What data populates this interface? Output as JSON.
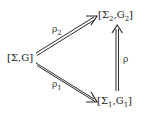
{
  "diagram": {
    "type": "commutative-triangle",
    "nodes": [
      {
        "id": "sigma_g",
        "open": "[",
        "main1": "Σ",
        "sub1": "",
        "sep": ",",
        "main2": "G",
        "sub2": "",
        "close": "]",
        "x": 8,
        "y": 61
      },
      {
        "id": "sigma2_g2",
        "open": "[",
        "main1": "Σ",
        "sub1": "2",
        "sep": ",",
        "main2": "G",
        "sub2": "2",
        "close": "]",
        "x": 99,
        "y": 18
      },
      {
        "id": "sigma1_g1",
        "open": "[",
        "main1": "Σ",
        "sub1": "1",
        "sep": ",",
        "main2": "G",
        "sub2": "1",
        "close": "]",
        "x": 98,
        "y": 104
      }
    ],
    "edges": [
      {
        "id": "rho2",
        "from": "sigma_g",
        "to": "sigma2_g2",
        "label_main": "ρ",
        "label_sub": "2"
      },
      {
        "id": "rho1",
        "from": "sigma_g",
        "to": "sigma1_g1",
        "label_main": "ρ",
        "label_sub": "1"
      },
      {
        "id": "rho",
        "from": "sigma1_g1",
        "to": "sigma2_g2",
        "label_main": "ρ",
        "label_sub": ""
      }
    ],
    "colors": {
      "stroke": "#2a2a2a",
      "text": "#222222",
      "background": "#ffffff"
    }
  }
}
